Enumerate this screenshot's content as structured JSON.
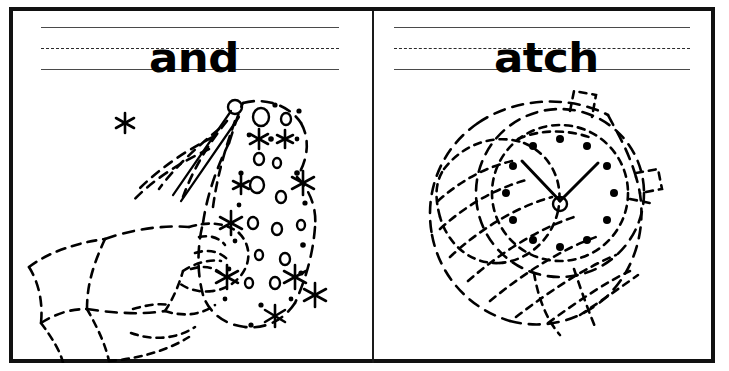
{
  "worksheet": {
    "type": "handwriting-tracing-worksheet",
    "background_color": "#ffffff",
    "ink_color": "#000000",
    "frame_color": "#111111",
    "rule_color": "#4a4a4a",
    "panel_count": 2
  },
  "panels": [
    {
      "id": "left",
      "word": "and",
      "word_label": "and",
      "picture_name": "magic-wand-in-hand",
      "picture_description": "A hand with a shirt cuff holding a sparkler wand that sprays stars, circles and dots",
      "guide_lines": {
        "top": "solid",
        "middle": "dashed",
        "bottom": "solid"
      }
    },
    {
      "id": "right",
      "word": "atch",
      "word_label": "atch",
      "picture_name": "wrist-watch",
      "picture_description": "A wrist watch with a round dial, twelve dot hour markers, two hands, a crown and a hatched cylindrical band",
      "guide_lines": {
        "top": "solid",
        "middle": "dashed",
        "bottom": "solid"
      }
    }
  ]
}
